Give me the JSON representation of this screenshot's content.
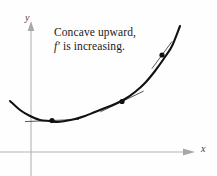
{
  "figure": {
    "kind": "calculus-concavity-diagram",
    "background_color": "#fefefe",
    "annotation": {
      "line1": "Concave upward,",
      "line2_prefix": "f′",
      "line2_rest": " is increasing."
    },
    "axes": {
      "x_label": "x",
      "y_label": "y",
      "axis_color": "#b3b3b3",
      "x_axis_y": 152,
      "y_axis_x": 31,
      "x_arrow_tip": 192,
      "y_arrow_tip": 22
    },
    "curve": {
      "color": "#111111",
      "stroke_width": 2.1
    },
    "tangent": {
      "color": "#444444",
      "stroke_width": 0.9
    },
    "points": {
      "color": "#111111",
      "radius": 2.6
    }
  },
  "chart_data": {
    "type": "line",
    "title": "",
    "subtitle": "",
    "xlabel": "x",
    "ylabel": "y",
    "grid": false,
    "legend": null,
    "annotations": [
      {
        "text": "Concave upward, f′ is increasing.",
        "x_px": 54,
        "y_px": 25
      }
    ],
    "axis_px": {
      "x_axis_y": 152,
      "y_axis_x": 31,
      "x_axis_from": 0,
      "x_axis_to": 192,
      "y_axis_from": 22,
      "y_axis_to": 176
    },
    "series": [
      {
        "name": "f",
        "description": "concave upward curve",
        "points_px": [
          [
            10,
            101
          ],
          [
            20,
            110
          ],
          [
            30,
            116
          ],
          [
            40,
            120
          ],
          [
            50,
            121
          ],
          [
            57,
            122
          ],
          [
            65,
            121
          ],
          [
            75,
            119
          ],
          [
            85,
            116
          ],
          [
            95,
            112
          ],
          [
            105,
            108
          ],
          [
            115,
            104
          ],
          [
            125,
            99
          ],
          [
            135,
            92
          ],
          [
            145,
            83
          ],
          [
            155,
            71
          ],
          [
            165,
            57
          ],
          [
            172,
            46
          ],
          [
            180,
            26
          ]
        ]
      }
    ],
    "marked_points": [
      {
        "label": "point-1",
        "x_px": 52,
        "y_px": 120.5,
        "tangent_slope": -0.04,
        "tangent_half_length_px": 27,
        "note": "tangent nearly horizontal"
      },
      {
        "label": "point-2",
        "x_px": 122,
        "y_px": 101.5,
        "tangent_slope": -0.48,
        "tangent_half_length_px": 24,
        "note": "tangent moderate positive slope"
      },
      {
        "label": "point-3",
        "x_px": 162,
        "y_px": 55,
        "tangent_slope": -1.35,
        "tangent_half_length_px": 17,
        "note": "tangent steep positive slope"
      }
    ]
  }
}
